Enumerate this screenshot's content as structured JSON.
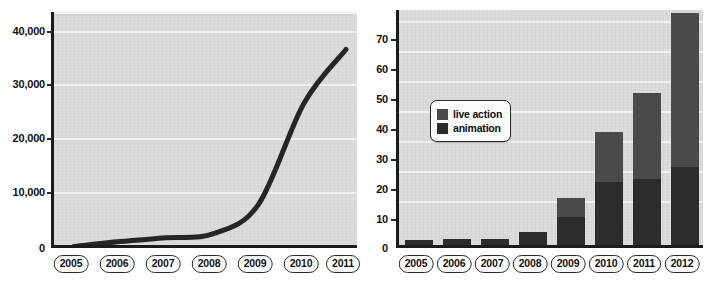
{
  "figure": {
    "background_color": "#ffffff",
    "plot_background_color": "#d9d9d9",
    "axis_color": "#1b1b1b",
    "gridline_color": "#f2f2f2"
  },
  "chart_data": [
    {
      "id": "left-line-chart",
      "type": "line",
      "title": "",
      "subtitle": "",
      "xlabel": "",
      "ylabel": "",
      "categories": [
        "2005",
        "2006",
        "2007",
        "2008",
        "2009",
        "2010",
        "2011"
      ],
      "x": [
        2005,
        2006,
        2007,
        2008,
        2009,
        2010,
        2011
      ],
      "values": [
        300,
        1200,
        1900,
        2600,
        8000,
        27000,
        37000
      ],
      "series": [
        {
          "name": "",
          "color": "#262626",
          "values": [
            300,
            1200,
            1900,
            2600,
            8000,
            27000,
            37000
          ]
        }
      ],
      "ylim": [
        0,
        44000
      ],
      "ytick_values": [
        0,
        10000,
        20000,
        30000,
        40000
      ],
      "ytick_labels": [
        "0",
        "10,000",
        "20,000",
        "30,000",
        "40,000"
      ],
      "grid": true,
      "grid_axis": "y",
      "legend": false,
      "legend_position": "none"
    },
    {
      "id": "right-stacked-bar-chart",
      "type": "bar",
      "stacked": true,
      "title": "",
      "subtitle": "",
      "xlabel": "",
      "ylabel": "",
      "categories": [
        "2005",
        "2006",
        "2007",
        "2008",
        "2009",
        "2010",
        "2011",
        "2012"
      ],
      "series": [
        {
          "name": "animation",
          "color": "#2c2c2c",
          "values": [
            1.5,
            2,
            2,
            4,
            9,
            20,
            21,
            25
          ]
        },
        {
          "name": "live action",
          "color": "#4a4a4a",
          "values": [
            0,
            0,
            0,
            0,
            6,
            16,
            27.5,
            49
          ]
        }
      ],
      "totals": [
        1.5,
        2,
        2,
        4,
        15,
        36,
        48.5,
        74
      ],
      "ylim": [
        0,
        76
      ],
      "ytick_values": [
        0,
        10,
        20,
        30,
        40,
        50,
        60,
        70
      ],
      "ytick_labels": [
        "0",
        "10",
        "20",
        "30",
        "40",
        "50",
        "60",
        "70"
      ],
      "grid": true,
      "grid_axis": "y",
      "legend": true,
      "legend_position": "upper-left-inside",
      "legend_entries": [
        {
          "label": "live action",
          "color": "#4a4a4a",
          "swatch": "live-action-swatch"
        },
        {
          "label": "animation",
          "color": "#2c2c2c",
          "swatch": "animation-swatch"
        }
      ]
    }
  ]
}
